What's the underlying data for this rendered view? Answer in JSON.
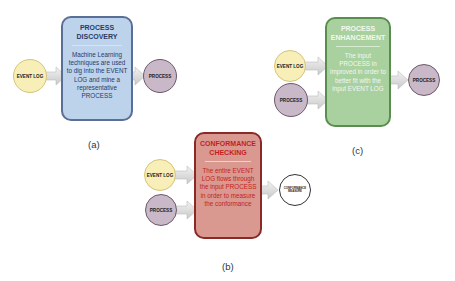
{
  "panels": {
    "a": {
      "caption": "(a)",
      "box": {
        "title": "PROCESS DISCOVERY",
        "description": "Machine Learning techniques are used to dig into the EVENT LOG and mine a representative PROCESS",
        "color": "#bdd3ec"
      },
      "inputs": [
        {
          "label": "EVENT LOG",
          "color": "#f7efb7"
        }
      ],
      "output": {
        "label": "PROCESS",
        "color": "#c9b8c8"
      }
    },
    "b": {
      "caption": "(b)",
      "box": {
        "title": "CONFORMANCE CHECKING",
        "description": "The entire EVENT LOG flows through the input PROCESS in order to measure the conformance",
        "color": "#d99890"
      },
      "inputs": [
        {
          "label": "EVENT LOG",
          "color": "#f7efb7"
        },
        {
          "label": "PROCESS",
          "color": "#c9b8c8"
        }
      ],
      "output": {
        "label": "CONFORMANCE MEASURE",
        "color": "#ffffff"
      }
    },
    "c": {
      "caption": "(c)",
      "box": {
        "title": "PROCESS ENHANCEMENT",
        "description": "The input PROCESS in improved in order to better fit with the input EVENT LOG",
        "color": "#a9d09f"
      },
      "inputs": [
        {
          "label": "EVENT LOG",
          "color": "#f7efb7"
        },
        {
          "label": "PROCESS",
          "color": "#c9b8c8"
        }
      ],
      "output": {
        "label": "PROCESS",
        "color": "#c9b8c8"
      }
    }
  }
}
